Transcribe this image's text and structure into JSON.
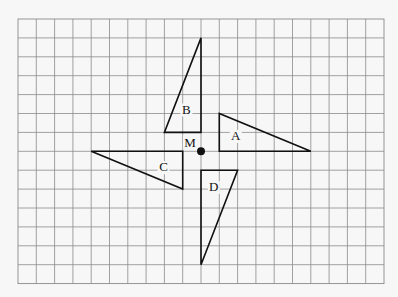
{
  "diagram": {
    "type": "grid_transformation",
    "grid": {
      "columns": 20,
      "rows": 14,
      "origin_px": [
        18,
        19
      ],
      "cell_w_px": 18.3,
      "cell_h_px": 18.9,
      "line_color": "#8a8a8a",
      "background": "#f7f7f7"
    },
    "point": {
      "label": "M",
      "grid": [
        10,
        7
      ]
    },
    "shapes": [
      {
        "label": "A",
        "vertices": [
          [
            11,
            5
          ],
          [
            11,
            7
          ],
          [
            16,
            7
          ]
        ],
        "label_grid": [
          11.9,
          6.4
        ]
      },
      {
        "label": "B",
        "vertices": [
          [
            10,
            1
          ],
          [
            8,
            6
          ],
          [
            10,
            6
          ]
        ],
        "label_grid": [
          9.2,
          5.0
        ]
      },
      {
        "label": "C",
        "vertices": [
          [
            4,
            7
          ],
          [
            9,
            7
          ],
          [
            9,
            9
          ]
        ],
        "label_grid": [
          7.95,
          8.05
        ]
      },
      {
        "label": "D",
        "vertices": [
          [
            10,
            8
          ],
          [
            12,
            8
          ],
          [
            10,
            13
          ]
        ],
        "label_grid": [
          10.7,
          9.1
        ]
      }
    ],
    "stroke_color": "#111111"
  }
}
